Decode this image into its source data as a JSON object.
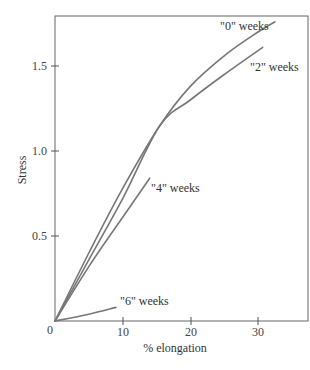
{
  "chart_data": {
    "type": "line",
    "title": "",
    "xlabel": "% elongation",
    "ylabel": "Stress",
    "xlim": [
      0,
      37.3
    ],
    "ylim": [
      0,
      1.79
    ],
    "xticks": [
      10,
      20,
      30
    ],
    "xtick_labels": [
      "10",
      "20",
      "30"
    ],
    "yticks": [
      0.5,
      1.0,
      1.5
    ],
    "ytick_labels": [
      "0.5",
      "1.0",
      "1.5"
    ],
    "origin_label": "0",
    "grid": false,
    "legend": "inline labels at curve ends",
    "series": [
      {
        "name": "\"0\" weeks",
        "x": [
          0,
          5,
          10,
          15.5,
          20,
          25,
          30,
          32.5
        ],
        "y": [
          0,
          0.4,
          0.78,
          1.15,
          1.38,
          1.56,
          1.7,
          1.76
        ]
      },
      {
        "name": "\"2\" weeks",
        "x": [
          0,
          5,
          10,
          15.5,
          20,
          25,
          30.7
        ],
        "y": [
          0,
          0.36,
          0.72,
          1.15,
          1.3,
          1.45,
          1.61
        ]
      },
      {
        "name": "\"4\" weeks",
        "x": [
          0,
          5,
          10,
          14
        ],
        "y": [
          0,
          0.32,
          0.61,
          0.84
        ]
      },
      {
        "name": "\"6\" weeks",
        "x": [
          0,
          5,
          9
        ],
        "y": [
          0,
          0.04,
          0.08
        ]
      }
    ]
  },
  "labels": {
    "x_axis": "% elongation",
    "y_axis": "Stress",
    "origin": "0",
    "x_ticks": [
      "10",
      "20",
      "30"
    ],
    "y_ticks": [
      "0.5",
      "1.0",
      "1.5"
    ],
    "series": [
      "\"0\" weeks",
      "\"2\" weeks",
      "\"4\" weeks",
      "\"6\" weeks"
    ]
  }
}
